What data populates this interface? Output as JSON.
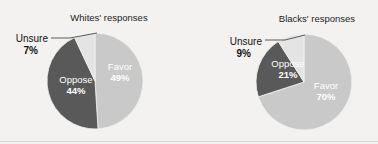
{
  "background_color": "#f3f2f0",
  "palette": {
    "favor": "#c9c9c9",
    "oppose": "#595959",
    "unsure": "#e4e4e4",
    "label_dark": "#111111",
    "label_light": "#ffffff",
    "leader_line": "#4a4a4a"
  },
  "chart_data": [
    {
      "type": "pie",
      "title": "Whites' responses",
      "categories": [
        "Favor",
        "Oppose",
        "Unsure"
      ],
      "values": [
        49,
        44,
        7
      ],
      "value_labels": [
        "49%",
        "44%",
        "7%"
      ],
      "colors": [
        "#c9c9c9",
        "#595959",
        "#e4e4e4"
      ],
      "start_angle_deg": 0,
      "direction": "clockwise",
      "legend": "none",
      "labels_inside": [
        "Favor",
        "Oppose"
      ],
      "labels_callout": [
        "Unsure"
      ],
      "center": [
        95,
        81
      ],
      "radius": 48
    },
    {
      "type": "pie",
      "title": "Blacks' responses",
      "categories": [
        "Favor",
        "Oppose",
        "Unsure"
      ],
      "values": [
        70,
        21,
        9
      ],
      "value_labels": [
        "70%",
        "21%",
        "9%"
      ],
      "colors": [
        "#c9c9c9",
        "#595959",
        "#e4e4e4"
      ],
      "start_angle_deg": 0,
      "direction": "clockwise",
      "legend": "none",
      "labels_inside": [
        "Favor",
        "Oppose"
      ],
      "labels_callout": [
        "Unsure"
      ],
      "center": [
        304,
        82
      ],
      "radius": 48
    }
  ],
  "left_chart": {
    "title": "Whites' responses",
    "favor_label": "Favor",
    "favor_value": "49%",
    "oppose_label": "Oppose",
    "oppose_value": "44%",
    "unsure_label": "Unsure",
    "unsure_value": "7%"
  },
  "right_chart": {
    "title": "Blacks' responses",
    "favor_label": "Favor",
    "favor_value": "70%",
    "oppose_label": "Oppose",
    "oppose_value": "21%",
    "unsure_label": "Unsure",
    "unsure_value": "9%"
  }
}
